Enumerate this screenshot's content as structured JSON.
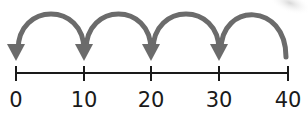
{
  "diagram": {
    "type": "number-line-jumps",
    "ticks": [
      {
        "value": 0,
        "label": "0",
        "x": 16
      },
      {
        "value": 10,
        "label": "10",
        "x": 84
      },
      {
        "value": 20,
        "label": "20",
        "x": 151
      },
      {
        "value": 30,
        "label": "30",
        "x": 219
      },
      {
        "value": 40,
        "label": "40",
        "x": 288
      }
    ],
    "jumps": [
      {
        "from": 40,
        "to": 30
      },
      {
        "from": 30,
        "to": 20
      },
      {
        "from": 20,
        "to": 10
      },
      {
        "from": 10,
        "to": 0
      }
    ],
    "jump_size": -10,
    "colors": {
      "arc": "#6b6b6b",
      "line": "#1a1a1a",
      "text": "#1a1a1a"
    }
  }
}
